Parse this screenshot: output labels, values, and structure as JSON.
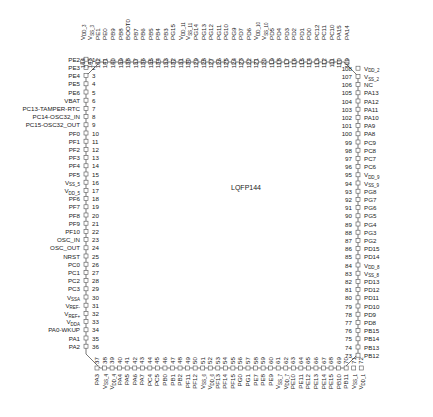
{
  "package": {
    "label": "LQFP144",
    "pin_count": 144,
    "colors": {
      "outline": "#555555",
      "text": "#222222",
      "background": "#ffffff"
    }
  },
  "sides": {
    "left": {
      "pins": [
        {
          "n": 1,
          "name": "PE2"
        },
        {
          "n": 2,
          "name": "PE3"
        },
        {
          "n": 3,
          "name": "PE4"
        },
        {
          "n": 4,
          "name": "PE5"
        },
        {
          "n": 5,
          "name": "PE6"
        },
        {
          "n": 6,
          "name": "VBAT"
        },
        {
          "n": 7,
          "name": "PC13-TAMPER-RTC"
        },
        {
          "n": 8,
          "name": "PC14-OSC32_IN"
        },
        {
          "n": 9,
          "name": "PC15-OSC32_OUT"
        },
        {
          "n": 10,
          "name": "PF0"
        },
        {
          "n": 11,
          "name": "PF1"
        },
        {
          "n": 12,
          "name": "PF2"
        },
        {
          "n": 13,
          "name": "PF3"
        },
        {
          "n": 14,
          "name": "PF4"
        },
        {
          "n": 15,
          "name": "PF5"
        },
        {
          "n": 16,
          "name": "V",
          "sub": "SS_5"
        },
        {
          "n": 17,
          "name": "V",
          "sub": "DD_5"
        },
        {
          "n": 18,
          "name": "PF6"
        },
        {
          "n": 19,
          "name": "PF7"
        },
        {
          "n": 20,
          "name": "PF8"
        },
        {
          "n": 21,
          "name": "PF9"
        },
        {
          "n": 22,
          "name": "PF10"
        },
        {
          "n": 23,
          "name": "OSC_IN"
        },
        {
          "n": 24,
          "name": "OSC_OUT"
        },
        {
          "n": 25,
          "name": "NRST"
        },
        {
          "n": 26,
          "name": "PC0"
        },
        {
          "n": 27,
          "name": "PC1"
        },
        {
          "n": 28,
          "name": "PC2"
        },
        {
          "n": 29,
          "name": "PC3"
        },
        {
          "n": 30,
          "name": "V",
          "sub": "SSA"
        },
        {
          "n": 31,
          "name": "V",
          "sub": "REF-"
        },
        {
          "n": 32,
          "name": "V",
          "sub": "REF+"
        },
        {
          "n": 33,
          "name": "V",
          "sub": "DDA"
        },
        {
          "n": 34,
          "name": "PA0-WKUP"
        },
        {
          "n": 35,
          "name": "PA1"
        },
        {
          "n": 36,
          "name": "PA2"
        }
      ]
    },
    "bottom": {
      "pins": [
        {
          "n": 37,
          "name": "PA3"
        },
        {
          "n": 38,
          "name": "V",
          "sub": "SS_4"
        },
        {
          "n": 39,
          "name": "V",
          "sub": "DD_4"
        },
        {
          "n": 40,
          "name": "PA4"
        },
        {
          "n": 41,
          "name": "PA5"
        },
        {
          "n": 42,
          "name": "PA6"
        },
        {
          "n": 43,
          "name": "PA7"
        },
        {
          "n": 44,
          "name": "PC4"
        },
        {
          "n": 45,
          "name": "PC5"
        },
        {
          "n": 46,
          "name": "PB0"
        },
        {
          "n": 47,
          "name": "PB1"
        },
        {
          "n": 48,
          "name": "PB2"
        },
        {
          "n": 49,
          "name": "PF11"
        },
        {
          "n": 50,
          "name": "PF12"
        },
        {
          "n": 51,
          "name": "V",
          "sub": "SS_6"
        },
        {
          "n": 52,
          "name": "V",
          "sub": "DD_6"
        },
        {
          "n": 53,
          "name": "PF13"
        },
        {
          "n": 54,
          "name": "PF14"
        },
        {
          "n": 55,
          "name": "PF15"
        },
        {
          "n": 56,
          "name": "PG0"
        },
        {
          "n": 57,
          "name": "PG1"
        },
        {
          "n": 58,
          "name": "PE7"
        },
        {
          "n": 59,
          "name": "PE8"
        },
        {
          "n": 60,
          "name": "PE9"
        },
        {
          "n": 61,
          "name": "V",
          "sub": "SS_7"
        },
        {
          "n": 62,
          "name": "V",
          "sub": "DD_7"
        },
        {
          "n": 63,
          "name": "PE10"
        },
        {
          "n": 64,
          "name": "PE11"
        },
        {
          "n": 65,
          "name": "PE12"
        },
        {
          "n": 66,
          "name": "PE13"
        },
        {
          "n": 67,
          "name": "PE14"
        },
        {
          "n": 68,
          "name": "PE15"
        },
        {
          "n": 69,
          "name": "PB10"
        },
        {
          "n": 70,
          "name": "PB11"
        },
        {
          "n": 71,
          "name": "V",
          "sub": "SS_1"
        },
        {
          "n": 72,
          "name": "V",
          "sub": "DD_1"
        }
      ]
    },
    "right": {
      "pins": [
        {
          "n": 73,
          "name": "PB12"
        },
        {
          "n": 74,
          "name": "PB13"
        },
        {
          "n": 75,
          "name": "PB14"
        },
        {
          "n": 76,
          "name": "PB15"
        },
        {
          "n": 77,
          "name": "PD8"
        },
        {
          "n": 78,
          "name": "PD9"
        },
        {
          "n": 79,
          "name": "PD10"
        },
        {
          "n": 80,
          "name": "PD11"
        },
        {
          "n": 81,
          "name": "PD12"
        },
        {
          "n": 82,
          "name": "PD13"
        },
        {
          "n": 83,
          "name": "V",
          "sub": "SS_8"
        },
        {
          "n": 84,
          "name": "V",
          "sub": "DD_8"
        },
        {
          "n": 85,
          "name": "PD14"
        },
        {
          "n": 86,
          "name": "PD15"
        },
        {
          "n": 87,
          "name": "PG2"
        },
        {
          "n": 88,
          "name": "PG3"
        },
        {
          "n": 89,
          "name": "PG4"
        },
        {
          "n": 90,
          "name": "PG5"
        },
        {
          "n": 91,
          "name": "PG6"
        },
        {
          "n": 92,
          "name": "PG7"
        },
        {
          "n": 93,
          "name": "PG8"
        },
        {
          "n": 94,
          "name": "V",
          "sub": "SS_9"
        },
        {
          "n": 95,
          "name": "V",
          "sub": "DD_9"
        },
        {
          "n": 96,
          "name": "PC6"
        },
        {
          "n": 97,
          "name": "PC7"
        },
        {
          "n": 98,
          "name": "PC8"
        },
        {
          "n": 99,
          "name": "PC9"
        },
        {
          "n": 100,
          "name": "PA8"
        },
        {
          "n": 101,
          "name": "PA9"
        },
        {
          "n": 102,
          "name": "PA10"
        },
        {
          "n": 103,
          "name": "PA11"
        },
        {
          "n": 104,
          "name": "PA12"
        },
        {
          "n": 105,
          "name": "PA13"
        },
        {
          "n": 106,
          "name": "NC"
        },
        {
          "n": 107,
          "name": "V",
          "sub": "SS_2"
        },
        {
          "n": 108,
          "name": "V",
          "sub": "DD_2"
        }
      ]
    },
    "top": {
      "pins": [
        {
          "n": 109,
          "name": "PA14"
        },
        {
          "n": 110,
          "name": "PA15"
        },
        {
          "n": 111,
          "name": "PC10"
        },
        {
          "n": 112,
          "name": "PC11"
        },
        {
          "n": 113,
          "name": "PC12"
        },
        {
          "n": 114,
          "name": "PD0"
        },
        {
          "n": 115,
          "name": "PD1"
        },
        {
          "n": 116,
          "name": "PD2"
        },
        {
          "n": 117,
          "name": "PD3"
        },
        {
          "n": 118,
          "name": "PD4"
        },
        {
          "n": 119,
          "name": "PD5"
        },
        {
          "n": 120,
          "name": "V",
          "sub": "SS_10"
        },
        {
          "n": 121,
          "name": "V",
          "sub": "DD_10"
        },
        {
          "n": 122,
          "name": "PD6"
        },
        {
          "n": 123,
          "name": "PD7"
        },
        {
          "n": 124,
          "name": "PG9"
        },
        {
          "n": 125,
          "name": "PG10"
        },
        {
          "n": 126,
          "name": "PG11"
        },
        {
          "n": 127,
          "name": "PG12"
        },
        {
          "n": 128,
          "name": "PG13"
        },
        {
          "n": 129,
          "name": "PG14"
        },
        {
          "n": 130,
          "name": "V",
          "sub": "SS_11"
        },
        {
          "n": 131,
          "name": "V",
          "sub": "DD_11"
        },
        {
          "n": 132,
          "name": "PG15"
        },
        {
          "n": 133,
          "name": "PB3"
        },
        {
          "n": 134,
          "name": "PB4"
        },
        {
          "n": 135,
          "name": "PB5"
        },
        {
          "n": 136,
          "name": "PB6"
        },
        {
          "n": 137,
          "name": "PB7"
        },
        {
          "n": 138,
          "name": "BOOT0"
        },
        {
          "n": 139,
          "name": "PB8"
        },
        {
          "n": 140,
          "name": "PB9"
        },
        {
          "n": 141,
          "name": "PE0"
        },
        {
          "n": 142,
          "name": "PE1"
        },
        {
          "n": 143,
          "name": "V",
          "sub": "SS_3"
        },
        {
          "n": 144,
          "name": "V",
          "sub": "DD_3"
        }
      ]
    }
  }
}
